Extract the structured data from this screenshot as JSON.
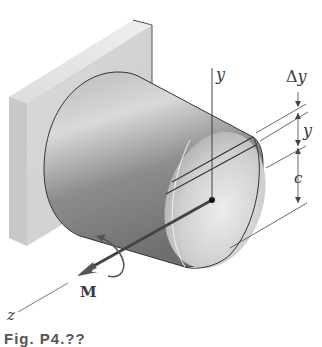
{
  "figure": {
    "labels": {
      "y_axis": "y",
      "z_axis": "z",
      "moment": "M",
      "strip_thickness": "Δy",
      "strip_distance": "y",
      "radius": "c"
    },
    "caption": "Fig. P4.??",
    "colors": {
      "wall_front": "#d6d6d6",
      "wall_side": "#c2c2c2",
      "wall_top": "#e6e6e6",
      "cylinder_dark": "#7a7a7a",
      "cylinder_light": "#e2e2e2",
      "lines": "#3a3a3a"
    }
  }
}
